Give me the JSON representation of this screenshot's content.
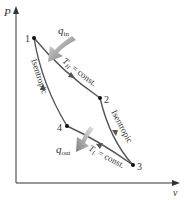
{
  "diagram": {
    "axes": {
      "y_label": "P",
      "x_label": "v"
    },
    "states": [
      {
        "id": "1",
        "label": "1"
      },
      {
        "id": "2",
        "label": "2"
      },
      {
        "id": "3",
        "label": "3"
      },
      {
        "id": "4",
        "label": "4"
      }
    ],
    "processes": {
      "p12": "T_H = const.",
      "p23": "Isentropic",
      "p34": "T_L = const.",
      "p41": "Isentropic"
    },
    "heat": {
      "in": "q",
      "in_sub": "in",
      "out": "q",
      "out_sub": "out"
    },
    "th_main": "T",
    "th_sub": "H",
    "th_rest": " = const.",
    "tl_main": "T",
    "tl_sub": "L",
    "tl_rest": " = const.",
    "colors": {
      "curve": "#555555",
      "axis": "#333333",
      "arrow_in": "#888888",
      "arrow_out": "#999999"
    }
  }
}
